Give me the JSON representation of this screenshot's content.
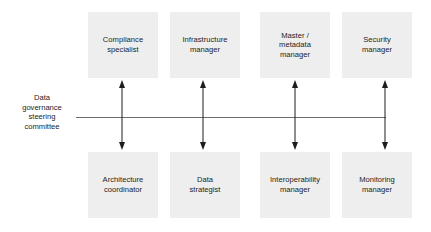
{
  "diagram": {
    "type": "org-relationship-diagram",
    "hub": {
      "label": "Data\ngovernance\nsteering\ncommittee",
      "lines": [
        "Data",
        "governance",
        "steering",
        "committee"
      ]
    },
    "colors": {
      "node_fill": "#eeeeee",
      "text": "#1d1d1d",
      "line": "#6c6c6c",
      "arrow": "#1d1d1d",
      "background": "#ffffff"
    },
    "top_nodes": [
      {
        "label": "Compliance\nspecialist",
        "name": "compliance-specialist"
      },
      {
        "label": "Infrastructure\nmanager",
        "name": "infrastructure-manager"
      },
      {
        "label": "Master /\nmetadata\nmanager",
        "name": "master-metadata-manager"
      },
      {
        "label": "Security\nmanager",
        "name": "security-manager"
      }
    ],
    "bottom_nodes": [
      {
        "label": "Architecture\ncoordinator",
        "name": "architecture-coordinator"
      },
      {
        "label": "Data\nstrategist",
        "name": "data-strategist"
      },
      {
        "label": "Interoperability\nmanager",
        "name": "interoperability-manager"
      },
      {
        "label": "Monitoring\nmanager",
        "name": "monitoring-manager"
      }
    ],
    "connectors": [
      {
        "name": "connector-compliance-architecture",
        "kind": "double-headed-arrow"
      },
      {
        "name": "connector-infrastructure-data-strategist",
        "kind": "double-headed-arrow"
      },
      {
        "name": "connector-master-interoperability",
        "kind": "double-headed-arrow"
      },
      {
        "name": "connector-security-monitoring",
        "kind": "double-headed-arrow"
      }
    ],
    "backbone": {
      "name": "committee-backbone-line",
      "orientation": "horizontal"
    }
  }
}
